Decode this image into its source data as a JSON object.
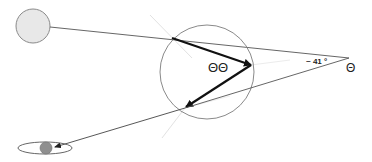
{
  "diagram": {
    "labels": {
      "drop_label": "ΘΘ",
      "angle_label": "~ 41 °",
      "observer_label": "Θ"
    },
    "elements": {
      "sun": {
        "cx": 33,
        "cy": 26,
        "r": 17,
        "fill": "#e8e8e8",
        "stroke": "#8a8a8a"
      },
      "raindrop": {
        "cx": 207,
        "cy": 72,
        "r": 47,
        "stroke": "#8a8a8a"
      },
      "observer_apex": {
        "x": 349,
        "y": 58
      },
      "target_ellipse": {
        "cx": 45,
        "cy": 148,
        "rx": 27,
        "ry": 6,
        "stroke": "#555555"
      },
      "target_dot": {
        "cx": 46,
        "cy": 148,
        "r": 6,
        "fill": "#8f8f8f"
      }
    },
    "colors": {
      "thin_line": "#555555",
      "bold_arrow": "#111111",
      "faint_line": "#dddddd"
    }
  }
}
